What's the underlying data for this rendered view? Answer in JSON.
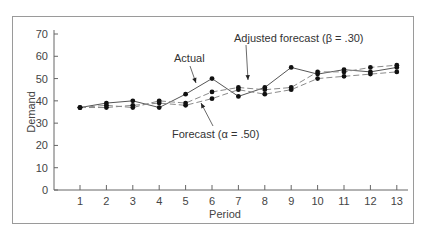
{
  "chart_data": {
    "type": "line",
    "title": "",
    "xlabel": "Period",
    "ylabel": "Demand",
    "x": [
      1,
      2,
      3,
      4,
      5,
      6,
      7,
      8,
      9,
      10,
      11,
      12,
      13
    ],
    "x_ticks": [
      "1",
      "2",
      "3",
      "4",
      "5",
      "6",
      "7",
      "8",
      "9",
      "10",
      "11",
      "12",
      "13"
    ],
    "y_ticks": [
      "0",
      "10",
      "20",
      "30",
      "40",
      "50",
      "60",
      "70"
    ],
    "ylim": [
      0,
      70
    ],
    "grid": false,
    "legend_position": "annotations",
    "series": [
      {
        "name": "Actual",
        "style": "solid",
        "values": [
          37,
          39,
          40,
          37,
          43,
          50,
          42,
          46,
          55,
          52,
          54,
          53,
          55
        ]
      },
      {
        "name": "Forecast (α = .50)",
        "style": "dashed",
        "values": [
          37,
          37,
          38,
          39,
          38,
          41,
          45,
          43,
          45,
          50,
          51,
          52,
          53
        ]
      },
      {
        "name": "Adjusted forecast (β = .30)",
        "style": "dashed",
        "values": [
          37,
          38,
          37,
          40,
          39,
          44,
          46,
          45,
          46,
          53,
          53,
          55,
          56
        ]
      }
    ],
    "annotations": [
      {
        "text": "Actual",
        "points_to_period": 6,
        "series": "Actual"
      },
      {
        "text": "Adjusted forecast (β = .30)",
        "points_to_period": 7,
        "series": "Adjusted forecast (β = .30)"
      },
      {
        "text": "Forecast (α = .50)",
        "points_to_period": 6,
        "series": "Forecast (α = .50)"
      }
    ]
  },
  "labels": {
    "xlabel": "Period",
    "ylabel": "Demand",
    "annot_actual": "Actual",
    "annot_adjusted": "Adjusted forecast (β = .30)",
    "annot_forecast": "Forecast (α = .50)"
  },
  "colors": {
    "line": "#555555",
    "marker": "#111111",
    "axis": "#666666",
    "frame": "#9a9a9a"
  }
}
